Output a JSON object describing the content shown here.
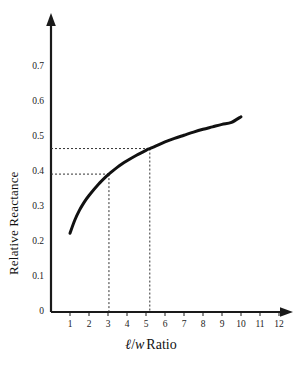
{
  "chart_data": {
    "type": "line",
    "title": "",
    "xlabel": "ℓ/w Ratio",
    "ylabel": "Relative Reactance",
    "xlim": [
      0,
      12.6
    ],
    "ylim": [
      0,
      0.78
    ],
    "grid": false,
    "legend": "none",
    "x_ticks": [
      "1",
      "2",
      "3",
      "4",
      "5",
      "6",
      "7",
      "8",
      "9",
      "10",
      "11",
      "12"
    ],
    "x_tick_values": [
      1,
      2,
      3,
      4,
      5,
      6,
      7,
      8,
      9,
      10,
      11,
      12
    ],
    "y_ticks": [
      "0",
      "0.1",
      "0.2",
      "0.3",
      "0.4",
      "0.5",
      "0.6",
      "0.7"
    ],
    "y_tick_values": [
      0,
      0.1,
      0.2,
      0.3,
      0.4,
      0.5,
      0.6,
      0.7
    ],
    "series": [
      {
        "name": "Relative Reactance",
        "color": "#111111",
        "x": [
          1.0,
          1.25,
          1.5,
          1.75,
          2.0,
          2.5,
          3.0,
          3.05,
          3.5,
          4.0,
          4.5,
          5.0,
          5.2,
          5.5,
          6.0,
          6.5,
          7.0,
          7.5,
          8.0,
          8.5,
          9.0,
          9.5,
          10.0
        ],
        "y": [
          0.225,
          0.262,
          0.291,
          0.314,
          0.333,
          0.365,
          0.392,
          0.394,
          0.414,
          0.432,
          0.448,
          0.462,
          0.467,
          0.474,
          0.486,
          0.496,
          0.505,
          0.514,
          0.522,
          0.529,
          0.536,
          0.542,
          0.558
        ]
      }
    ],
    "annotations": [
      {
        "name": "guide-lower",
        "x": 3.05,
        "y": 0.394,
        "style": "dashed-crosshair",
        "description": "dashed horizontal line from y-axis to curve at y=0.394 and dashed vertical drop to x-axis at x=3.05"
      },
      {
        "name": "guide-upper",
        "x": 5.2,
        "y": 0.467,
        "style": "dashed-crosshair",
        "description": "dashed horizontal line from y-axis to curve at y=0.467 and dashed vertical drop to x-axis at x=5.2"
      }
    ],
    "axis_style": {
      "arrow_heads": true,
      "axis_color": "#1a1a1a",
      "curve_width_px": 3
    }
  },
  "axis_titles": {
    "x_ell": "ℓ",
    "x_slash": "/",
    "x_w": "w",
    "x_ratio_word": "Ratio",
    "y": "Relative Reactance"
  }
}
